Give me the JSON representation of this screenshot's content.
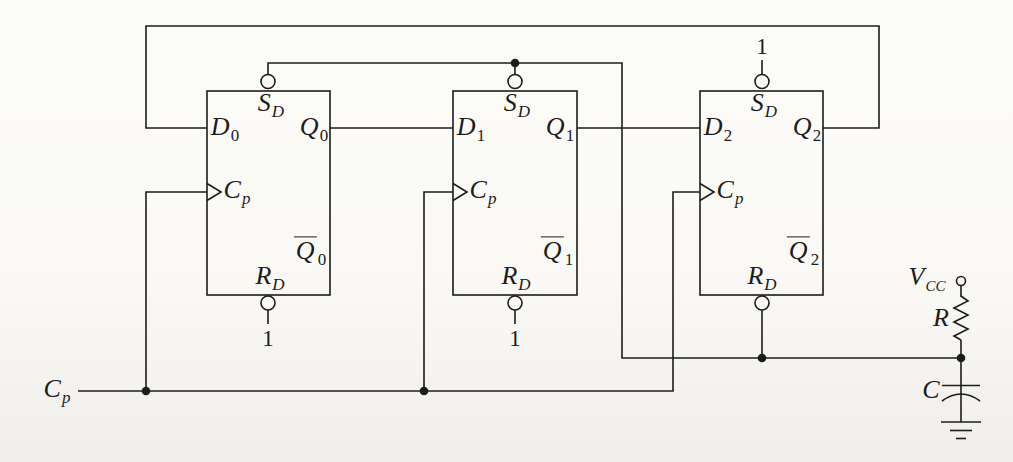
{
  "figure": {
    "ink_color": "#1c1c1c",
    "paper_color": "#fbfaf6"
  },
  "flipflops": [
    {
      "set": {
        "main": "S",
        "sub": "D"
      },
      "d": {
        "main": "D",
        "sub": "0"
      },
      "q": {
        "main": "Q",
        "sub": "0"
      },
      "clock": {
        "main": "C",
        "sub": "p"
      },
      "qbar": {
        "main": "Q",
        "sub": "0"
      },
      "reset": {
        "main": "R",
        "sub": "D"
      },
      "reset_tie": "1"
    },
    {
      "set": {
        "main": "S",
        "sub": "D"
      },
      "d": {
        "main": "D",
        "sub": "1"
      },
      "q": {
        "main": "Q",
        "sub": "1"
      },
      "clock": {
        "main": "C",
        "sub": "p"
      },
      "qbar": {
        "main": "Q",
        "sub": "1"
      },
      "reset": {
        "main": "R",
        "sub": "D"
      },
      "reset_tie": "1"
    },
    {
      "set": {
        "main": "S",
        "sub": "D"
      },
      "d": {
        "main": "D",
        "sub": "2"
      },
      "q": {
        "main": "Q",
        "sub": "2"
      },
      "clock": {
        "main": "C",
        "sub": "p"
      },
      "qbar": {
        "main": "Q",
        "sub": "2"
      },
      "reset": {
        "main": "R",
        "sub": "D"
      },
      "set_tie": "1"
    }
  ],
  "external": {
    "clock_input": {
      "main": "C",
      "sub": "p"
    },
    "vcc": {
      "main": "V",
      "sub": "CC"
    },
    "resistor": "R",
    "capacitor": "C"
  }
}
